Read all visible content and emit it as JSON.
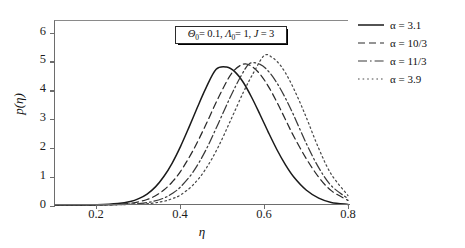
{
  "chart_data": {
    "type": "line",
    "title": "",
    "xlabel": "η",
    "ylabel": "p(η)",
    "xlim": [
      0.1,
      0.8
    ],
    "ylim": [
      0,
      6.4
    ],
    "xticks": [
      0.2,
      0.4,
      0.6,
      0.8
    ],
    "xtick_labels": [
      "0.2",
      "0.4",
      "0.6",
      "0.8"
    ],
    "yticks": [
      0,
      1,
      2,
      3,
      4,
      5,
      6
    ],
    "ytick_labels": [
      "0",
      "1",
      "2",
      "3",
      "4",
      "5",
      "6"
    ],
    "grid": false,
    "legend_position": "outside right top",
    "annotation": {
      "theta_symbol": "Θ",
      "theta_sub": "0",
      "theta_value": "0.1",
      "lambda_symbol": "Λ",
      "lambda_sub": "0",
      "lambda_value": "1",
      "j_symbol": "J",
      "j_value": "3",
      "text": "Θ₀= 0.1, Λ₀= 1, J = 3"
    },
    "series": [
      {
        "name": "α = 3.1",
        "alpha": "3.1",
        "style": "solid",
        "color": "#1a1a1a",
        "peak_x": 0.485,
        "peak_y": 4.85,
        "sigma": 0.072,
        "x": [
          0.1,
          0.15,
          0.2,
          0.25,
          0.28,
          0.3,
          0.32,
          0.34,
          0.36,
          0.38,
          0.4,
          0.42,
          0.44,
          0.46,
          0.485,
          0.51,
          0.53,
          0.55,
          0.57,
          0.59,
          0.61,
          0.63,
          0.65,
          0.67,
          0.7,
          0.73,
          0.76,
          0.8
        ],
        "y": [
          0.0,
          0.0,
          0.01,
          0.05,
          0.12,
          0.22,
          0.38,
          0.63,
          0.99,
          1.46,
          2.04,
          2.7,
          3.39,
          4.05,
          4.72,
          4.8,
          4.63,
          4.26,
          3.74,
          3.14,
          2.52,
          1.93,
          1.41,
          0.98,
          0.52,
          0.24,
          0.09,
          0.02
        ]
      },
      {
        "name": "α = 10/3",
        "alpha": "10/3",
        "style": "dashed",
        "color": "#2a2a2a",
        "peak_x": 0.522,
        "peak_y": 4.95,
        "sigma": 0.073,
        "x": [
          0.1,
          0.15,
          0.2,
          0.25,
          0.28,
          0.3,
          0.32,
          0.34,
          0.36,
          0.38,
          0.4,
          0.43,
          0.46,
          0.49,
          0.522,
          0.55,
          0.57,
          0.59,
          0.61,
          0.63,
          0.65,
          0.67,
          0.7,
          0.73,
          0.76,
          0.8
        ],
        "y": [
          0.0,
          0.0,
          0.0,
          0.02,
          0.06,
          0.11,
          0.19,
          0.32,
          0.52,
          0.8,
          1.17,
          1.9,
          2.78,
          3.72,
          4.58,
          4.9,
          4.82,
          4.55,
          4.12,
          3.58,
          2.99,
          2.4,
          1.62,
          0.97,
          0.5,
          0.16
        ]
      },
      {
        "name": "α = 11/3",
        "alpha": "11/3",
        "style": "dashdot",
        "color": "#3a3a3a",
        "peak_x": 0.565,
        "peak_y": 5.0,
        "sigma": 0.072,
        "x": [
          0.1,
          0.2,
          0.25,
          0.3,
          0.33,
          0.36,
          0.38,
          0.4,
          0.43,
          0.46,
          0.49,
          0.52,
          0.545,
          0.565,
          0.59,
          0.61,
          0.63,
          0.65,
          0.67,
          0.7,
          0.73,
          0.76,
          0.8
        ],
        "y": [
          0.0,
          0.0,
          0.01,
          0.05,
          0.11,
          0.24,
          0.4,
          0.63,
          1.15,
          1.9,
          2.83,
          3.79,
          4.5,
          4.92,
          4.89,
          4.65,
          4.25,
          3.73,
          3.13,
          2.15,
          1.3,
          0.67,
          0.22
        ]
      },
      {
        "name": "α = 3.9",
        "alpha": "3.9",
        "style": "dotted",
        "color": "#4a4a4a",
        "peak_x": 0.6,
        "peak_y": 5.25,
        "sigma": 0.068,
        "x": [
          0.1,
          0.2,
          0.28,
          0.33,
          0.36,
          0.38,
          0.4,
          0.43,
          0.46,
          0.49,
          0.52,
          0.55,
          0.575,
          0.6,
          0.62,
          0.64,
          0.66,
          0.68,
          0.7,
          0.73,
          0.76,
          0.8
        ],
        "y": [
          0.0,
          0.0,
          0.02,
          0.06,
          0.13,
          0.22,
          0.35,
          0.7,
          1.25,
          2.02,
          2.96,
          3.92,
          4.62,
          5.2,
          5.12,
          4.83,
          4.35,
          3.74,
          3.06,
          1.97,
          1.07,
          0.33
        ]
      }
    ]
  },
  "legend": {
    "items": [
      {
        "label": "α = 3.1",
        "style": "solid"
      },
      {
        "label": "α = 10/3",
        "style": "dashed"
      },
      {
        "label": "α = 11/3",
        "style": "dashdot"
      },
      {
        "label": "α = 3.9",
        "style": "dotted"
      }
    ]
  }
}
